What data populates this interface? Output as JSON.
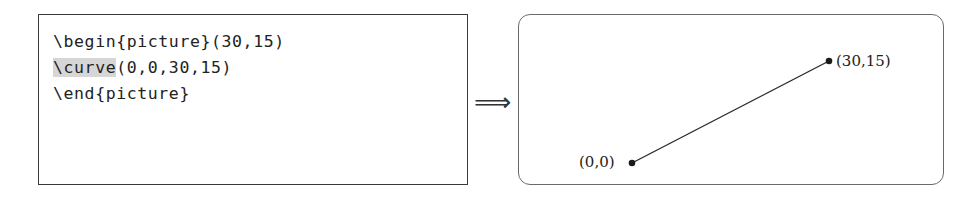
{
  "source_panel": {
    "lines": [
      {
        "text": "\\begin{picture}(30,15)"
      },
      {
        "highlight": "\\curve",
        "rest": "(0,0,30,15)"
      },
      {
        "text": "\\end{picture}"
      }
    ]
  },
  "arrow": {
    "glyph": "⟹"
  },
  "output_panel": {
    "points": [
      {
        "label": "(0,0)",
        "x": 632,
        "y": 163
      },
      {
        "label": "(30,15)",
        "x": 829,
        "y": 61
      }
    ],
    "line_color": "#2b2b2b",
    "dot_color": "#1a1a1a"
  }
}
